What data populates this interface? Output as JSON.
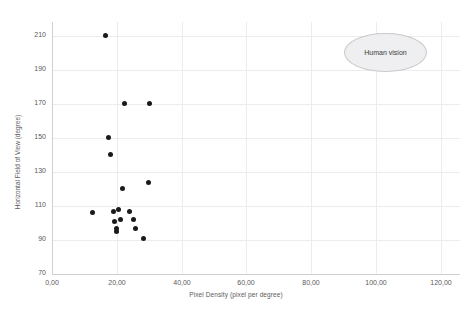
{
  "chart_data": {
    "type": "scatter",
    "title": "",
    "xlabel": "Pixel Density (pixel per degree)",
    "ylabel": "Horizontal Field of View (degree)",
    "xlim": [
      0,
      126
    ],
    "ylim": [
      70,
      218
    ],
    "xticks": [
      "0,00",
      "20,00",
      "40,00",
      "60,00",
      "80,00",
      "100,00",
      "120,00"
    ],
    "xtick_values": [
      0,
      20,
      40,
      60,
      80,
      100,
      120
    ],
    "yticks": [
      "70",
      "90",
      "110",
      "130",
      "150",
      "170",
      "190",
      "210"
    ],
    "ytick_values": [
      70,
      90,
      110,
      130,
      150,
      170,
      190,
      210
    ],
    "grid": true,
    "legend": "none",
    "series": [
      {
        "name": "HMD devices",
        "marker": "filled-circle",
        "color": "#1a1a1a",
        "points": [
          {
            "x": 16.4,
            "y": 210
          },
          {
            "x": 22.4,
            "y": 170
          },
          {
            "x": 30.0,
            "y": 170
          },
          {
            "x": 17.3,
            "y": 150
          },
          {
            "x": 18.2,
            "y": 140
          },
          {
            "x": 21.8,
            "y": 120
          },
          {
            "x": 29.7,
            "y": 124
          },
          {
            "x": 12.4,
            "y": 106
          },
          {
            "x": 19.1,
            "y": 107
          },
          {
            "x": 20.6,
            "y": 108
          },
          {
            "x": 23.9,
            "y": 107
          },
          {
            "x": 19.4,
            "y": 101
          },
          {
            "x": 21.2,
            "y": 102
          },
          {
            "x": 25.2,
            "y": 102
          },
          {
            "x": 20.0,
            "y": 97
          },
          {
            "x": 20.0,
            "y": 95
          },
          {
            "x": 25.8,
            "y": 97
          },
          {
            "x": 28.2,
            "y": 91
          }
        ]
      }
    ],
    "annotations": [
      {
        "type": "ellipse",
        "label": "Human vision",
        "x_center": 103.0,
        "y_center": 200.0,
        "x_radius": 12.7,
        "y_radius": 11.5,
        "fill": "#efeff1",
        "stroke": "#c9c9cc"
      }
    ]
  }
}
